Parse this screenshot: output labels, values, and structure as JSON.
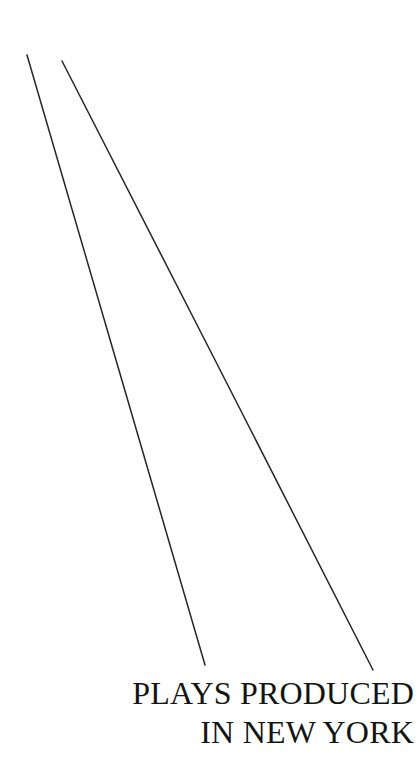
{
  "figure": {
    "background_color": "#ffffff",
    "width": 417,
    "height": 760,
    "caption": {
      "line1": "PLAYS PRODUCED",
      "line2": "IN NEW YORK",
      "align": "right",
      "color": "#141414"
    }
  },
  "chart_data": {
    "type": "line",
    "title": "PLAYS PRODUCED IN NEW YORK",
    "subtitle": "",
    "xlabel": "",
    "ylabel": "",
    "grid": false,
    "legend": null,
    "axis_visible": false,
    "tick_labels_x": [],
    "tick_labels_y": [],
    "note": "Cropped detail of a printed line chart: two descending straight rules with caption at lower right.",
    "line_color": "#262626",
    "line_width": 1.5,
    "series": [
      {
        "name": "line-1",
        "points": [
          {
            "x": 27,
            "y": 55
          },
          {
            "x": 116,
            "y": 360
          },
          {
            "x": 205,
            "y": 665
          }
        ],
        "start": {
          "x": 27,
          "y": 55
        },
        "end": {
          "x": 205,
          "y": 665
        },
        "slope_dx_dy": 0.292
      },
      {
        "name": "line-2",
        "points": [
          {
            "x": 62,
            "y": 61
          },
          {
            "x": 215,
            "y": 360
          },
          {
            "x": 373,
            "y": 670
          }
        ],
        "start": {
          "x": 62,
          "y": 61
        },
        "end": {
          "x": 373,
          "y": 670
        },
        "slope_dx_dy": 0.511
      }
    ]
  }
}
